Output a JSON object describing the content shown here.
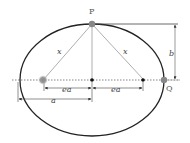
{
  "diagram": {
    "labels": {
      "top_point": "P",
      "right_point": "Q",
      "left_focal_distance": "x",
      "right_focal_distance": "x",
      "semi_minor": "b",
      "focus_offset_left": "ea",
      "focus_offset_right": "ea",
      "semi_major": "a"
    },
    "colors": {
      "ellipse": "#222222",
      "construction": "#999999",
      "point_grey": "#888888",
      "point_black": "#111111"
    }
  }
}
